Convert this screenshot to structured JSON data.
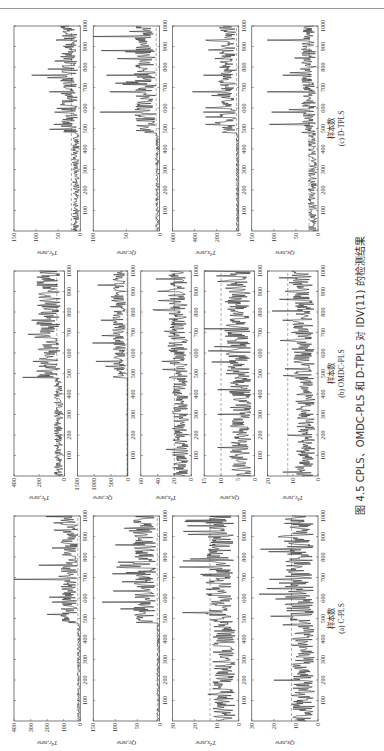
{
  "page_header": "",
  "caption": "图 4.5  CPLS、OMDC-PLS 和 D-TPLS 对 IDV(11) 的检测结果",
  "chart_data": [
    {
      "type": "line",
      "panel": "(a) C-PLS",
      "xlabel": "样本数",
      "x_ticks": [
        100,
        200,
        300,
        400,
        500,
        600,
        700,
        800,
        900,
        1000
      ],
      "xlim": [
        0,
        1000
      ],
      "fault_start": 480,
      "subplots": [
        {
          "ylabel": "T²c,new",
          "ylim": [
            0,
            400
          ],
          "yticks": [
            0,
            100,
            200,
            300,
            400
          ],
          "threshold": 15,
          "pre_level": 12,
          "post_level": 80,
          "peaks": [
            [
              520,
              200
            ],
            [
              580,
              170
            ],
            [
              690,
              420
            ],
            [
              760,
              250
            ],
            [
              930,
              160
            ]
          ]
        },
        {
          "ylabel": "Qc,new",
          "ylim": [
            0,
            150
          ],
          "yticks": [
            0,
            50,
            100,
            150
          ],
          "threshold": 5,
          "pre_level": 4,
          "post_level": 40,
          "peaks": [
            [
              580,
              130
            ],
            [
              680,
              85
            ],
            [
              760,
              90
            ],
            [
              860,
              100
            ],
            [
              940,
              80
            ]
          ]
        },
        {
          "ylabel": "T²x,new",
          "ylim": [
            0,
            30
          ],
          "yticks": [
            0,
            10,
            20,
            30
          ],
          "threshold": 13,
          "pre_level": 8,
          "post_level": 10,
          "peaks": [
            [
              130,
              14
            ],
            [
              580,
              12
            ],
            [
              790,
              22
            ],
            [
              910,
              23
            ],
            [
              980,
              24
            ]
          ]
        },
        {
          "ylabel": "Qx,new",
          "ylim": [
            0,
            30
          ],
          "yticks": [
            0,
            10,
            20,
            30
          ],
          "threshold": 12,
          "pre_level": 8,
          "post_level": 10,
          "peaks": [
            [
              200,
              20
            ],
            [
              470,
              16
            ],
            [
              690,
              22
            ],
            [
              900,
              17
            ]
          ]
        }
      ]
    },
    {
      "type": "line",
      "panel": "(b) OMDC-PLS",
      "xlabel": "样本数",
      "x_ticks": [
        100,
        200,
        300,
        400,
        500,
        600,
        700,
        800,
        900,
        1000
      ],
      "xlim": [
        0,
        1000
      ],
      "fault_start": 480,
      "subplots": [
        {
          "ylabel": "T²c,new",
          "ylim": [
            0,
            400
          ],
          "yticks": [
            0,
            200,
            400
          ],
          "threshold": 60,
          "pre_level": 55,
          "post_level": 150,
          "peaks": [
            [
              560,
              250
            ],
            [
              690,
              290
            ],
            [
              760,
              260
            ],
            [
              930,
              220
            ]
          ]
        },
        {
          "ylabel": "Qc,new",
          "ylim": [
            0,
            1500
          ],
          "yticks": [
            0,
            500,
            1000,
            1500
          ],
          "threshold": 20,
          "pre_level": 12,
          "post_level": 300,
          "peaks": [
            [
              560,
              950
            ],
            [
              650,
              1050
            ],
            [
              760,
              800
            ],
            [
              930,
              900
            ]
          ]
        },
        {
          "ylabel": "T²x,new",
          "ylim": [
            0,
            60
          ],
          "yticks": [
            0,
            20,
            40,
            60
          ],
          "threshold": 20,
          "pre_level": 15,
          "post_level": 18,
          "peaks": [
            [
              130,
              30
            ],
            [
              560,
              35
            ],
            [
              900,
              40
            ],
            [
              960,
              42
            ]
          ]
        },
        {
          "ylabel": "Qx,new",
          "ylim": [
            0,
            15
          ],
          "yticks": [
            0,
            5,
            10,
            15
          ],
          "threshold": 10,
          "pre_level": 5,
          "post_level": 6,
          "peaks": [
            [
              140,
              11
            ],
            [
              300,
              11
            ],
            [
              420,
              11
            ],
            [
              630,
              12
            ],
            [
              950,
              11
            ]
          ]
        },
        {
          "ylabel": "T²c,new",
          "ylim": [
            0,
            20
          ],
          "yticks": [
            0,
            10,
            20
          ],
          "threshold": 12,
          "pre_level": 6,
          "post_level": 7,
          "peaks": [
            [
              20,
              14
            ],
            [
              200,
              12
            ],
            [
              660,
              15
            ],
            [
              760,
              14
            ],
            [
              900,
              13
            ]
          ]
        }
      ]
    },
    {
      "type": "line",
      "panel": "(c) D-TPLS",
      "xlabel": "样本数",
      "x_ticks": [
        100,
        200,
        300,
        400,
        500,
        600,
        700,
        800,
        900,
        1000
      ],
      "xlim": [
        0,
        1000
      ],
      "fault_start": 480,
      "subplots": [
        {
          "ylabel": "T²c,new",
          "ylim": [
            0,
            150
          ],
          "yticks": [
            0,
            50,
            100,
            150
          ],
          "threshold": 20,
          "pre_level": 12,
          "post_level": 30,
          "peaks": [
            [
              520,
              60
            ],
            [
              580,
              58
            ],
            [
              680,
              70
            ],
            [
              760,
              110
            ],
            [
              930,
              55
            ]
          ]
        },
        {
          "ylabel": "Qc,new",
          "ylim": [
            0,
            100
          ],
          "yticks": [
            0,
            50,
            100
          ],
          "threshold": 5,
          "pre_level": 4,
          "post_level": 25,
          "peaks": [
            [
              580,
              90
            ],
            [
              680,
              75
            ],
            [
              760,
              80
            ],
            [
              880,
              88
            ],
            [
              950,
              100
            ]
          ]
        },
        {
          "ylabel": "T²x,new",
          "ylim": [
            0,
            600
          ],
          "yticks": [
            0,
            200,
            400,
            600
          ],
          "threshold": 20,
          "pre_level": 15,
          "post_level": 120,
          "peaks": [
            [
              520,
              300
            ],
            [
              580,
              320
            ],
            [
              680,
              420
            ],
            [
              760,
              320
            ],
            [
              930,
              300
            ]
          ]
        },
        {
          "ylabel": "Qx,new",
          "ylim": [
            0,
            150
          ],
          "yticks": [
            0,
            50,
            100,
            150
          ],
          "threshold": 20,
          "pre_level": 15,
          "post_level": 25,
          "peaks": [
            [
              520,
              110
            ],
            [
              580,
              105
            ],
            [
              680,
              115
            ],
            [
              760,
              80
            ],
            [
              930,
              115
            ]
          ]
        }
      ]
    }
  ]
}
